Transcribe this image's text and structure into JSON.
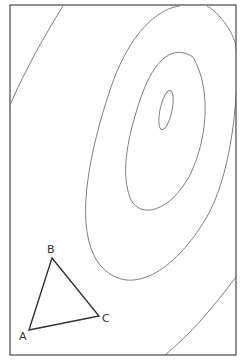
{
  "diagram": {
    "type": "contour-plot-with-triangle",
    "frame": {
      "x": 10,
      "y": 5,
      "width": 226,
      "height": 350,
      "color": "#555555"
    },
    "contour_color": "#777777",
    "triangle_color": "#333333",
    "contours": [
      {
        "name": "innermost-ellipse"
      },
      {
        "name": "contour-2"
      },
      {
        "name": "contour-3"
      },
      {
        "name": "contour-4"
      },
      {
        "name": "contour-left"
      }
    ],
    "triangle": {
      "vertices": [
        {
          "label": "A",
          "x": 29,
          "y": 330
        },
        {
          "label": "B",
          "x": 52,
          "y": 258
        },
        {
          "label": "C",
          "x": 99,
          "y": 316
        }
      ]
    }
  }
}
